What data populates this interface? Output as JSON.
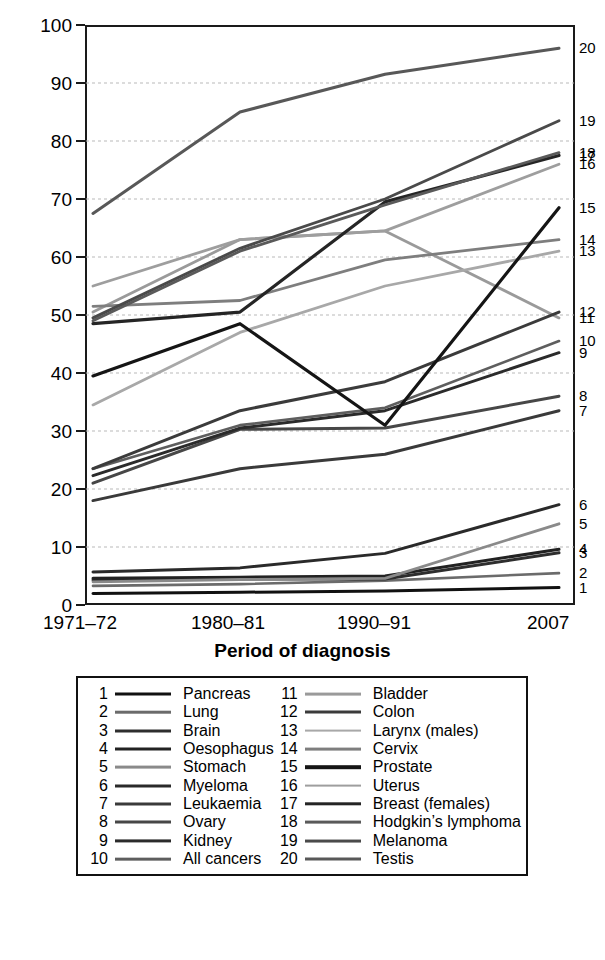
{
  "chart_data": {
    "type": "line",
    "title": "",
    "xlabel": "Period of diagnosis",
    "ylabel": "Percentage survival",
    "categories": [
      "1971–72",
      "1980–81",
      "1990–91",
      "2007"
    ],
    "ylim": [
      0,
      100
    ],
    "yticks": [
      0,
      10,
      20,
      30,
      40,
      50,
      60,
      70,
      80,
      90,
      100
    ],
    "grid": true,
    "legend_position": "below",
    "series": [
      {
        "id": 1,
        "name": "Pancreas",
        "values": [
          2.0,
          2.2,
          2.4,
          3.0
        ],
        "color": "#111111",
        "width": 3.0
      },
      {
        "id": 2,
        "name": "Lung",
        "values": [
          3.3,
          3.6,
          4.2,
          5.5
        ],
        "color": "#6b6b6b",
        "width": 2.6
      },
      {
        "id": 3,
        "name": "Brain",
        "values": [
          4.3,
          4.5,
          4.5,
          9.0
        ],
        "color": "#2e2e2e",
        "width": 3.0
      },
      {
        "id": 4,
        "name": "Oesophagus",
        "values": [
          4.6,
          4.8,
          5.0,
          9.6
        ],
        "color": "#222222",
        "width": 3.0
      },
      {
        "id": 5,
        "name": "Stomach",
        "values": [
          4.0,
          4.4,
          4.6,
          14.0
        ],
        "color": "#8a8a8a",
        "width": 2.8
      },
      {
        "id": 6,
        "name": "Myeloma",
        "values": [
          5.7,
          6.4,
          8.9,
          17.3
        ],
        "color": "#2a2a2a",
        "width": 3.0
      },
      {
        "id": 7,
        "name": "Leukaemia",
        "values": [
          18.0,
          23.5,
          26.0,
          33.5
        ],
        "color": "#3a3a3a",
        "width": 3.0
      },
      {
        "id": 8,
        "name": "Ovary",
        "values": [
          21.0,
          30.3,
          30.5,
          36.0
        ],
        "color": "#474747",
        "width": 3.0
      },
      {
        "id": 9,
        "name": "Kidney",
        "values": [
          22.3,
          30.5,
          33.5,
          43.5
        ],
        "color": "#2b2b2b",
        "width": 3.0
      },
      {
        "id": 10,
        "name": "All cancers",
        "values": [
          23.5,
          31.0,
          34.0,
          45.5
        ],
        "color": "#5e5e5e",
        "width": 2.7
      },
      {
        "id": 11,
        "name": "Bladder",
        "values": [
          50.5,
          63.0,
          64.5,
          49.5
        ],
        "color": "#9a9a9a",
        "width": 2.8
      },
      {
        "id": 12,
        "name": "Colon",
        "values": [
          23.5,
          33.5,
          38.5,
          50.5
        ],
        "color": "#3b3b3b",
        "width": 3.0
      },
      {
        "id": 13,
        "name": "Larynx (males)",
        "values": [
          34.5,
          47.0,
          55.0,
          61.0
        ],
        "color": "#a8a8a8",
        "width": 2.8
      },
      {
        "id": 14,
        "name": "Cervix",
        "values": [
          51.5,
          52.5,
          59.5,
          63.0
        ],
        "color": "#7e7e7e",
        "width": 2.8
      },
      {
        "id": 15,
        "name": "Prostate",
        "values": [
          39.5,
          48.5,
          31.0,
          68.5
        ],
        "color": "#151515",
        "width": 3.2
      },
      {
        "id": 16,
        "name": "Uterus",
        "values": [
          55.0,
          63.0,
          64.5,
          76.0
        ],
        "color": "#9e9e9e",
        "width": 2.8
      },
      {
        "id": 17,
        "name": "Breast (females)",
        "values": [
          48.5,
          50.5,
          69.5,
          77.5
        ],
        "color": "#252525",
        "width": 3.2
      },
      {
        "id": 18,
        "name": "Hodgkin's lymphoma",
        "values": [
          49.0,
          61.0,
          69.0,
          78.0
        ],
        "color": "#5a5a5a",
        "width": 2.8
      },
      {
        "id": 19,
        "name": "Melanoma",
        "values": [
          49.5,
          61.5,
          70.0,
          83.5
        ],
        "color": "#4a4a4a",
        "width": 2.9
      },
      {
        "id": 20,
        "name": "Testis",
        "values": [
          67.5,
          85.0,
          91.5,
          96.0
        ],
        "color": "#585858",
        "width": 3.0
      }
    ]
  },
  "axis": {
    "y_label": "Percentage survival",
    "x_label": "Period of diagnosis",
    "y_ticks": [
      "0",
      "10",
      "20",
      "30",
      "40",
      "50",
      "60",
      "70",
      "80",
      "90",
      "100"
    ],
    "x_ticks": [
      "1971–72",
      "1980–81",
      "1990–91",
      "2007"
    ]
  },
  "end_labels": [
    {
      "text": "20",
      "value": 96.0
    },
    {
      "text": "19",
      "value": 83.5
    },
    {
      "text": "18",
      "value": 78.0
    },
    {
      "text": "17",
      "value": 77.5
    },
    {
      "text": "16",
      "value": 76.0
    },
    {
      "text": "15",
      "value": 68.5
    },
    {
      "text": "14",
      "value": 63.0
    },
    {
      "text": "13",
      "value": 61.0
    },
    {
      "text": "12",
      "value": 50.5
    },
    {
      "text": "11",
      "value": 49.5
    },
    {
      "text": "10",
      "value": 45.5
    },
    {
      "text": "9",
      "value": 43.5
    },
    {
      "text": "8",
      "value": 36.0
    },
    {
      "text": "7",
      "value": 33.5
    },
    {
      "text": "6",
      "value": 17.3
    },
    {
      "text": "5",
      "value": 14.0
    },
    {
      "text": "4",
      "value": 9.6
    },
    {
      "text": "3",
      "value": 9.0
    },
    {
      "text": "2",
      "value": 5.5
    },
    {
      "text": "1",
      "value": 3.0
    }
  ],
  "legend": {
    "columns": [
      [
        {
          "num": "1",
          "label": "Pancreas",
          "color": "#111111",
          "width": 3.0
        },
        {
          "num": "2",
          "label": "Lung",
          "color": "#6b6b6b",
          "width": 2.6
        },
        {
          "num": "3",
          "label": "Brain",
          "color": "#2e2e2e",
          "width": 3.0
        },
        {
          "num": "4",
          "label": "Oesophagus",
          "color": "#222222",
          "width": 3.0
        },
        {
          "num": "5",
          "label": "Stomach",
          "color": "#8a8a8a",
          "width": 2.8
        },
        {
          "num": "6",
          "label": "Myeloma",
          "color": "#2a2a2a",
          "width": 3.0
        },
        {
          "num": "7",
          "label": "Leukaemia",
          "color": "#3a3a3a",
          "width": 3.0
        },
        {
          "num": "8",
          "label": "Ovary",
          "color": "#474747",
          "width": 3.0
        },
        {
          "num": "9",
          "label": "Kidney",
          "color": "#2b2b2b",
          "width": 3.2
        },
        {
          "num": "10",
          "label": "All cancers",
          "color": "#5e5e5e",
          "width": 2.7
        }
      ],
      [
        {
          "num": "11",
          "label": "Bladder",
          "color": "#9a9a9a",
          "width": 2.8
        },
        {
          "num": "12",
          "label": "Colon",
          "color": "#3b3b3b",
          "width": 3.0
        },
        {
          "num": "13",
          "label": "Larynx (males)",
          "color": "#a8a8a8",
          "width": 2.8
        },
        {
          "num": "14",
          "label": "Cervix",
          "color": "#7e7e7e",
          "width": 2.8
        },
        {
          "num": "15",
          "label": "Prostate",
          "color": "#151515",
          "width": 3.6
        },
        {
          "num": "16",
          "label": "Uterus",
          "color": "#9e9e9e",
          "width": 2.8
        },
        {
          "num": "17",
          "label": "Breast (females)",
          "color": "#252525",
          "width": 3.4
        },
        {
          "num": "18",
          "label": "Hodgkin’s lymphoma",
          "color": "#5a5a5a",
          "width": 2.8
        },
        {
          "num": "19",
          "label": "Melanoma",
          "color": "#4a4a4a",
          "width": 2.9
        },
        {
          "num": "20",
          "label": "Testis",
          "color": "#585858",
          "width": 3.0
        }
      ]
    ]
  }
}
